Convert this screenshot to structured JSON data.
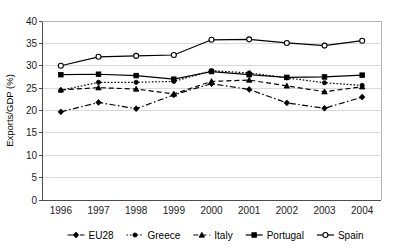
{
  "chart_data": {
    "type": "line",
    "title": "",
    "xlabel": "",
    "ylabel": "Exports/GDP (%)",
    "categories": [
      "1996",
      "1997",
      "1998",
      "1999",
      "2000",
      "2001",
      "2002",
      "2003",
      "2004"
    ],
    "ylim": [
      0,
      40
    ],
    "ytick_step": 5,
    "yticks": [
      "0",
      "5",
      "10",
      "15",
      "20",
      "25",
      "30",
      "35",
      "40"
    ],
    "grid": true,
    "legend_position": "bottom",
    "series": [
      {
        "name": "EU28",
        "marker": "filled-diamond",
        "line_style": "dash-dot",
        "color": "#000000",
        "values": [
          19.7,
          21.8,
          20.4,
          23.5,
          26.0,
          24.7,
          21.7,
          20.5,
          23.0
        ]
      },
      {
        "name": "Greece",
        "marker": "filled-circle",
        "line_style": "dotted",
        "color": "#000000",
        "values": [
          24.5,
          26.3,
          26.3,
          26.5,
          28.9,
          28.4,
          27.3,
          26.2,
          25.6
        ]
      },
      {
        "name": "Italy",
        "marker": "filled-triangle",
        "line_style": "dashed",
        "color": "#000000",
        "values": [
          24.6,
          25.1,
          24.8,
          23.7,
          26.5,
          26.8,
          25.5,
          24.2,
          25.3
        ]
      },
      {
        "name": "Portugal",
        "marker": "filled-square",
        "line_style": "solid",
        "color": "#000000",
        "values": [
          28.0,
          28.1,
          27.8,
          27.0,
          28.7,
          28.0,
          27.4,
          27.5,
          27.9
        ]
      },
      {
        "name": "Spain",
        "marker": "open-circle",
        "line_style": "solid",
        "color": "#000000",
        "values": [
          30.0,
          32.0,
          32.2,
          32.4,
          35.8,
          35.9,
          35.1,
          34.5,
          35.6
        ]
      }
    ]
  },
  "legend": {
    "items": [
      {
        "label": "EU28"
      },
      {
        "label": "Greece"
      },
      {
        "label": "Italy"
      },
      {
        "label": "Portugal"
      },
      {
        "label": "Spain"
      }
    ]
  }
}
